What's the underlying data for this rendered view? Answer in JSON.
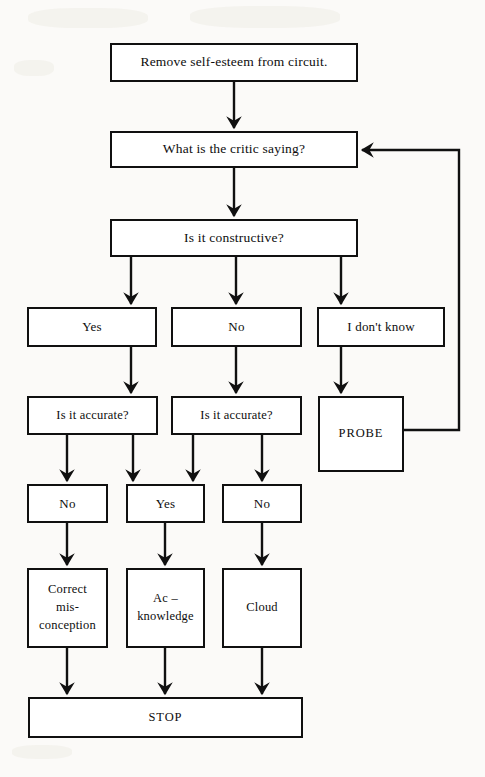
{
  "diagram": {
    "stroke_color": "#101010",
    "fill_color": "#ffffff",
    "background_color": "#fbfaf8"
  },
  "nodes": {
    "remove_self_esteem": {
      "label": "Remove self-esteem from circuit."
    },
    "what_critic_saying": {
      "label": "What is the critic saying?"
    },
    "is_constructive": {
      "label": "Is it constructive?"
    },
    "answer_yes": {
      "label": "Yes"
    },
    "answer_no": {
      "label": "No"
    },
    "answer_dont_know": {
      "label": "I don't know"
    },
    "is_accurate_left": {
      "label": "Is it accurate?"
    },
    "is_accurate_right": {
      "label": "Is it accurate?"
    },
    "probe": {
      "label": "PROBE"
    },
    "result_no_left": {
      "label": "No"
    },
    "result_yes_mid": {
      "label": "Yes"
    },
    "result_no_right": {
      "label": "No"
    },
    "correct_misconception": {
      "label": "Correct\nmis-\nconception"
    },
    "acknowledge": {
      "label": "Ac –\nknowledge"
    },
    "cloud": {
      "label": "Cloud"
    },
    "stop": {
      "label": "STOP"
    }
  },
  "edges": [
    {
      "from": "remove_self_esteem",
      "to": "what_critic_saying",
      "kind": "straight-down"
    },
    {
      "from": "what_critic_saying",
      "to": "is_constructive",
      "kind": "straight-down"
    },
    {
      "from": "is_constructive",
      "to": "answer_yes",
      "kind": "branch-down"
    },
    {
      "from": "is_constructive",
      "to": "answer_no",
      "kind": "branch-down"
    },
    {
      "from": "is_constructive",
      "to": "answer_dont_know",
      "kind": "branch-down"
    },
    {
      "from": "answer_yes",
      "to": "is_accurate_left",
      "kind": "straight-down"
    },
    {
      "from": "answer_no",
      "to": "is_accurate_right",
      "kind": "straight-down"
    },
    {
      "from": "answer_dont_know",
      "to": "probe",
      "kind": "straight-down"
    },
    {
      "from": "is_accurate_left",
      "to": "result_no_left",
      "kind": "branch-down"
    },
    {
      "from": "is_accurate_left",
      "to": "result_yes_mid",
      "kind": "branch-down"
    },
    {
      "from": "is_accurate_right",
      "to": "result_yes_mid",
      "kind": "branch-down"
    },
    {
      "from": "is_accurate_right",
      "to": "result_no_right",
      "kind": "branch-down"
    },
    {
      "from": "result_no_left",
      "to": "correct_misconception",
      "kind": "straight-down"
    },
    {
      "from": "result_yes_mid",
      "to": "acknowledge",
      "kind": "straight-down"
    },
    {
      "from": "result_no_right",
      "to": "cloud",
      "kind": "straight-down"
    },
    {
      "from": "correct_misconception",
      "to": "stop",
      "kind": "straight-down"
    },
    {
      "from": "acknowledge",
      "to": "stop",
      "kind": "straight-down"
    },
    {
      "from": "cloud",
      "to": "stop",
      "kind": "straight-down"
    },
    {
      "from": "probe",
      "to": "what_critic_saying",
      "kind": "feedback-loop-right"
    }
  ]
}
